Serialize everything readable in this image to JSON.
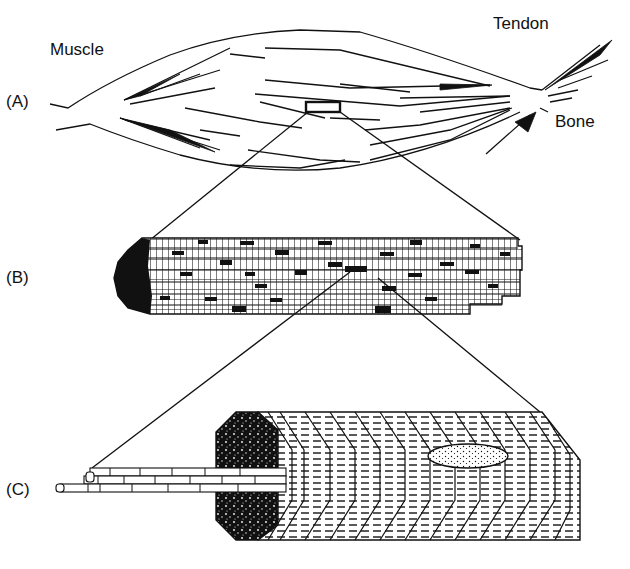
{
  "labels": {
    "muscle": "Muscle",
    "tendon": "Tendon",
    "bone": "Bone",
    "panel_a": "(A)",
    "panel_b": "(B)",
    "panel_c": "(C)"
  },
  "colors": {
    "ink": "#111111",
    "background": "#ffffff"
  }
}
